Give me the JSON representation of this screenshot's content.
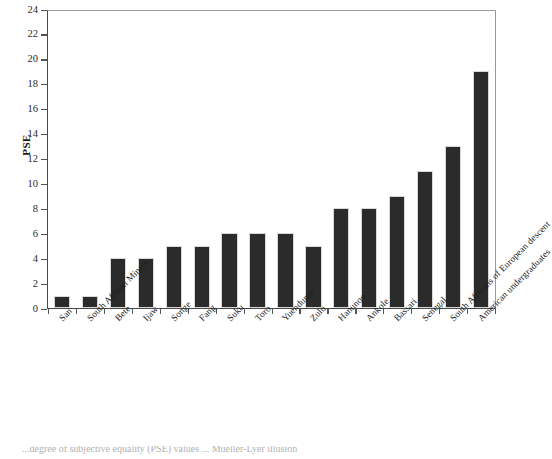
{
  "chart_data": {
    "type": "bar",
    "title": "",
    "xlabel": "",
    "ylabel": "PSE",
    "ylim": [
      0,
      24
    ],
    "ytick_step": 2,
    "grid": false,
    "legend": null,
    "bar_color": "#2b2b2b",
    "categories": [
      "San",
      "South African Miners",
      "Bete",
      "Ijaw",
      "Songe",
      "Fang",
      "Suku",
      "Toro",
      "Yuendumu",
      "Zulu",
      "Hanunoo",
      "Ankole",
      "Bassari",
      "Senegal",
      "South Africans of European descent",
      "American undergraduates"
    ],
    "values": [
      1,
      1,
      4,
      4,
      5,
      5,
      6,
      6,
      6,
      5,
      8,
      8,
      9,
      11,
      13,
      19
    ],
    "ytick_labels": [
      "0",
      "2",
      "4",
      "6",
      "8",
      "10",
      "12",
      "14",
      "16",
      "18",
      "20",
      "22",
      "24"
    ],
    "ytick_values": [
      0,
      2,
      4,
      6,
      8,
      10,
      12,
      14,
      16,
      18,
      20,
      22,
      24
    ]
  },
  "caption": {
    "text": "...degree of subjective equality (PSE) values ... Mueller-Lyer illusion"
  }
}
